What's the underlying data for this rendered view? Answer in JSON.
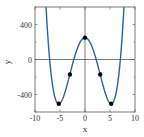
{
  "chart_data": {
    "type": "line",
    "title": "",
    "xlabel": "x",
    "ylabel": "y",
    "xlim": [
      -10,
      10
    ],
    "ylim": [
      -600,
      600
    ],
    "xticks": [
      -10,
      -5,
      0,
      5,
      10
    ],
    "xtick_labels": [
      "-10",
      "-5",
      "0",
      "5",
      "10"
    ],
    "yticks": [
      -400,
      0,
      400
    ],
    "ytick_labels": [
      "-400",
      "0",
      "400"
    ],
    "grid": false,
    "zero_lines": true,
    "series": [
      {
        "name": "y = x^4 - 55x^2 + 250",
        "color": "#2f5fa8",
        "x": [
          -7.6,
          -7.2,
          -6.8,
          -6.4,
          -6.0,
          -5.6,
          -5.24,
          -4.8,
          -4.4,
          -4.0,
          -3.6,
          -3.03,
          -2.5,
          -2.0,
          -1.5,
          -1.0,
          -0.5,
          0,
          0.5,
          1.0,
          1.5,
          2.0,
          2.5,
          3.03,
          3.6,
          4.0,
          4.4,
          4.8,
          5.24,
          5.6,
          6.0,
          6.4,
          6.8,
          7.2,
          7.6
        ],
        "y": [
          411.4,
          -8.4,
          -329.0,
          -325.1,
          -434.0,
          -491.3,
          -506.3,
          -486.4,
          -439.9,
          -374.0,
          -294.8,
          -170.5,
          -54.7,
          46.0,
          131.4,
          196.0,
          236.3,
          250.0,
          236.3,
          196.0,
          131.4,
          46.0,
          -54.7,
          -170.5,
          -294.8,
          -374.0,
          -439.9,
          -486.4,
          -506.3,
          -491.3,
          -434.0,
          -325.1,
          -329.0,
          -8.4,
          411.4
        ]
      }
    ],
    "markers": {
      "color": "#000000",
      "points": [
        {
          "label": "local minimum",
          "x": -5.24,
          "y": -506
        },
        {
          "label": "inflection point",
          "x": -3.03,
          "y": -170
        },
        {
          "label": "local maximum",
          "x": 0,
          "y": 250
        },
        {
          "label": "inflection point",
          "x": 3.03,
          "y": -170
        },
        {
          "label": "local minimum",
          "x": 5.24,
          "y": -506
        }
      ]
    }
  }
}
